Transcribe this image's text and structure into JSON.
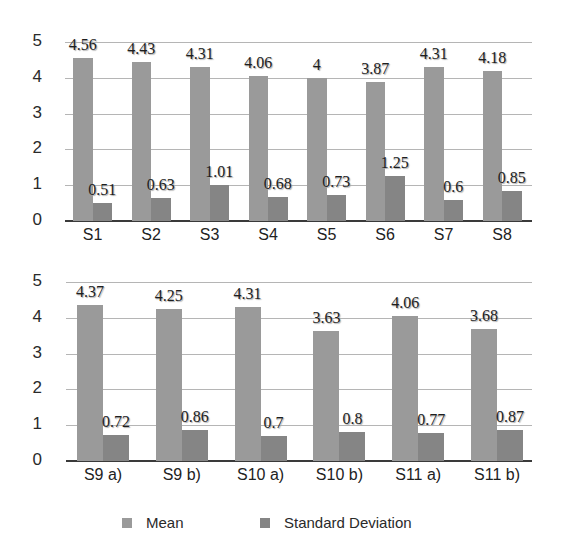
{
  "chart_data": [
    {
      "type": "bar",
      "title": "",
      "xlabel": "",
      "ylabel": "",
      "ylim": [
        0,
        5
      ],
      "yticks": [
        0,
        1,
        2,
        3,
        4,
        5
      ],
      "grid": true,
      "legend_position": "bottom",
      "categories": [
        "S1",
        "S2",
        "S3",
        "S4",
        "S5",
        "S6",
        "S7",
        "S8"
      ],
      "series": [
        {
          "name": "Mean",
          "values": [
            4.56,
            4.43,
            4.31,
            4.06,
            4,
            3.87,
            4.31,
            4.18
          ]
        },
        {
          "name": "Standard Deviation",
          "values": [
            0.51,
            0.63,
            1.01,
            0.68,
            0.73,
            1.25,
            0.6,
            0.85
          ]
        }
      ]
    },
    {
      "type": "bar",
      "title": "",
      "xlabel": "",
      "ylabel": "",
      "ylim": [
        0,
        5
      ],
      "yticks": [
        0,
        1,
        2,
        3,
        4,
        5
      ],
      "grid": true,
      "legend_position": "bottom",
      "categories": [
        "S9 a)",
        "S9 b)",
        "S10 a)",
        "S10 b)",
        "S11 a)",
        "S11 b)"
      ],
      "series": [
        {
          "name": "Mean",
          "values": [
            4.37,
            4.25,
            4.31,
            3.63,
            4.06,
            3.68
          ]
        },
        {
          "name": "Standard Deviation",
          "values": [
            0.72,
            0.86,
            0.7,
            0.8,
            0.77,
            0.87
          ]
        }
      ]
    }
  ],
  "legend": {
    "items": [
      {
        "label": "Mean",
        "color": "#9a9a9a"
      },
      {
        "label": "Standard Deviation",
        "color": "#858585"
      }
    ]
  },
  "colors": {
    "mean": "#9a9a9a",
    "sd": "#858585",
    "grid": "#b5b5b5",
    "axis": "#3a3a3a"
  }
}
